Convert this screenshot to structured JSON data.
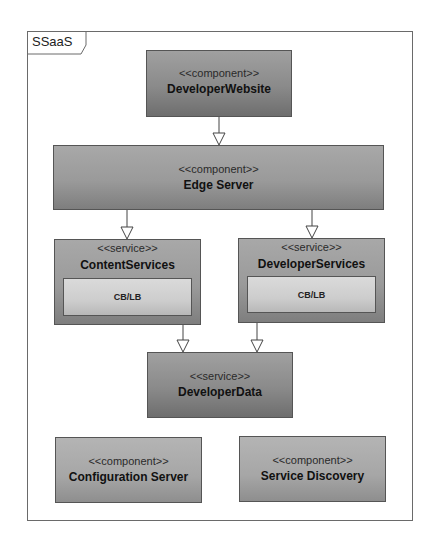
{
  "frame": {
    "label": "SSaaS"
  },
  "nodes": {
    "developer_website": {
      "stereotype": "<<component>>",
      "name": "DeveloperWebsite"
    },
    "edge_server": {
      "stereotype": "<<component>>",
      "name": "Edge Server"
    },
    "content_services": {
      "stereotype": "<<service>>",
      "name": "ContentServices",
      "inner": "CB/LB"
    },
    "developer_services": {
      "stereotype": "<<service>>",
      "name": "DeveloperServices",
      "inner": "CB/LB"
    },
    "developer_data": {
      "stereotype": "<<service>>",
      "name": "DeveloperData"
    },
    "configuration_server": {
      "stereotype": "<<component>>",
      "name": "Configuration Server"
    },
    "service_discovery": {
      "stereotype": "<<component>>",
      "name": "Service Discovery"
    }
  },
  "edges": [
    {
      "from": "DeveloperWebsite",
      "to": "Edge Server",
      "type": "dependency"
    },
    {
      "from": "Edge Server",
      "to": "ContentServices",
      "type": "dependency"
    },
    {
      "from": "Edge Server",
      "to": "DeveloperServices",
      "type": "dependency"
    },
    {
      "from": "ContentServices",
      "to": "DeveloperData",
      "type": "dependency"
    },
    {
      "from": "DeveloperServices",
      "to": "DeveloperData",
      "type": "dependency"
    }
  ]
}
